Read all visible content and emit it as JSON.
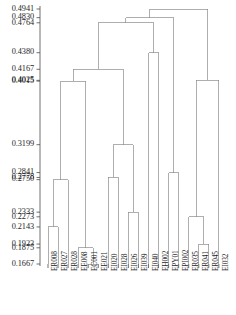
{
  "chart_data": {
    "type": "dendrogram",
    "title": "",
    "xlabel": "",
    "ylabel": "",
    "orientation": "vertical",
    "grid": false,
    "legend": null,
    "axis_line_color": "#4d4d4d",
    "link_color": "#8c8c8c",
    "ylim": [
      0.1667,
      0.4941
    ],
    "ytick_values": [
      0.4941,
      0.483,
      0.4764,
      0.438,
      0.4167,
      0.4025,
      0.4015,
      0.3199,
      0.2841,
      0.2778,
      0.275,
      0.2333,
      0.2273,
      0.2143,
      0.1923,
      0.1875,
      0.1667
    ],
    "ytick_labels": [
      "0.4941",
      "0.4830",
      "0.4764",
      "0.4380",
      "0.4167",
      "0.4025",
      "0.4015",
      "0.3199",
      "0.2841",
      "0.2778",
      "0.2750",
      "0.2333",
      "0.2273",
      "0.2143",
      "0.1923",
      "0.1875",
      "0.1667"
    ],
    "leaf_labels": [
      "ER008",
      "ER027",
      "ER028",
      "EE008",
      "EC001",
      "EE021",
      "EI020",
      "EI028",
      "EI026",
      "EI039",
      "EI040",
      "EH002",
      "EPY01",
      "EPI002",
      "ER035",
      "ER041",
      "ER045",
      "EI032"
    ],
    "leaf_count": 18,
    "merges": [
      {
        "id": "m1",
        "left": "EC001",
        "right": "EE021",
        "height": 0.1667
      },
      {
        "id": "m2",
        "left": "EE008",
        "right": "m1",
        "height": 0.1875
      },
      {
        "id": "m3",
        "left": "ER041",
        "right": "ER045",
        "height": 0.1923
      },
      {
        "id": "m4",
        "left": "ER008",
        "right": "ER027",
        "height": 0.2143
      },
      {
        "id": "m5",
        "left": "ER035",
        "right": "m3",
        "height": 0.2273
      },
      {
        "id": "m6",
        "left": "EI026",
        "right": "EI039",
        "height": 0.2333
      },
      {
        "id": "m7",
        "left": "m4",
        "right": "ER028",
        "height": 0.275
      },
      {
        "id": "m8",
        "left": "EI020",
        "right": "EI028",
        "height": 0.2778
      },
      {
        "id": "m9",
        "left": "EPY01",
        "right": "EPI002",
        "height": 0.2841
      },
      {
        "id": "m10",
        "left": "m8",
        "right": "m6",
        "height": 0.3199
      },
      {
        "id": "m11",
        "left": "m7",
        "right": "m2",
        "height": 0.4015
      },
      {
        "id": "m12",
        "left": "m5",
        "right": "EI032",
        "height": 0.4025
      },
      {
        "id": "m13",
        "left": "m11",
        "right": "m10",
        "height": 0.4167
      },
      {
        "id": "m14",
        "left": "EI040",
        "right": "EH002",
        "height": 0.438
      },
      {
        "id": "m15",
        "left": "m13",
        "right": "m14",
        "height": 0.4764
      },
      {
        "id": "m16",
        "left": "m15",
        "right": "m9",
        "height": 0.483
      },
      {
        "id": "m17",
        "left": "m16",
        "right": "m12",
        "height": 0.4941
      }
    ]
  }
}
